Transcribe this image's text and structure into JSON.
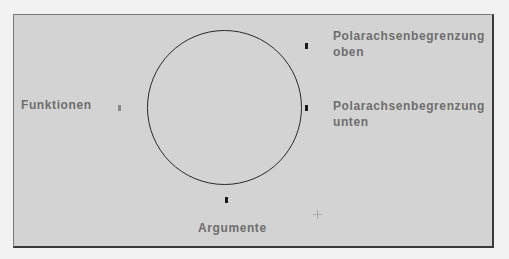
{
  "diagram": {
    "labels": {
      "functions": "Funktionen",
      "arguments": "Argumente",
      "polar_upper_line1": "Polarachsenbegrenzung",
      "polar_upper_line2": "oben",
      "polar_lower_line1": "Polarachsenbegrenzung",
      "polar_lower_line2": "unten"
    },
    "shape": "circle",
    "colors": {
      "panel_background": "#d3d3d3",
      "page_background": "#f2f2f2",
      "label_text": "#6e6e6e",
      "handle": "#1a1a1a",
      "circle_stroke": "#2a2a2a"
    }
  }
}
